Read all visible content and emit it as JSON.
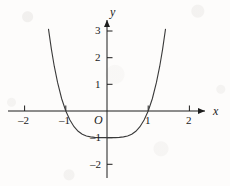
{
  "figure": {
    "background_color": "#fdfcfb",
    "ink_color": "#1d1d1d",
    "curve_color": "#3a3a3a"
  },
  "chart_data": {
    "type": "line",
    "title": "",
    "subtitle": "",
    "xlabel": "x",
    "ylabel": "y",
    "origin_label": "O",
    "xlim": [
      -2.6,
      2.95
    ],
    "ylim": [
      -2.6,
      3.6
    ],
    "grid": false,
    "legend": null,
    "x_ticks": [
      -2,
      -1,
      1,
      2
    ],
    "x_tick_labels": [
      "–2",
      "–1",
      "1",
      "2"
    ],
    "y_ticks": [
      -2,
      -1,
      1,
      2,
      3
    ],
    "y_tick_labels": [
      "–2",
      "–1",
      "1",
      "2",
      "3"
    ],
    "series": [
      {
        "name": "y = x⁴ − 1",
        "equation": "y = x^4 - 1",
        "x": [
          -1.42,
          -1.35,
          -1.28,
          -1.2,
          -1.1,
          -1.0,
          -0.9,
          -0.8,
          -0.7,
          -0.6,
          -0.5,
          -0.4,
          -0.3,
          -0.2,
          -0.1,
          0.0,
          0.1,
          0.2,
          0.3,
          0.4,
          0.5,
          0.6,
          0.7,
          0.8,
          0.9,
          1.0,
          1.1,
          1.2,
          1.28,
          1.35,
          1.42
        ],
        "y": [
          3.07,
          2.32,
          1.68,
          1.07,
          0.46,
          0.0,
          -0.34,
          -0.59,
          -0.76,
          -0.87,
          -0.94,
          -0.97,
          -0.99,
          -1.0,
          -1.0,
          -1.0,
          -1.0,
          -1.0,
          -0.99,
          -0.97,
          -0.94,
          -0.87,
          -0.76,
          -0.59,
          -0.34,
          0.0,
          0.46,
          1.07,
          1.68,
          2.32,
          3.07
        ]
      }
    ],
    "x_intercepts": [
      -1,
      1
    ],
    "minimum_point": [
      0,
      -1
    ],
    "axis_arrows": [
      "x-positive",
      "y-positive"
    ]
  }
}
